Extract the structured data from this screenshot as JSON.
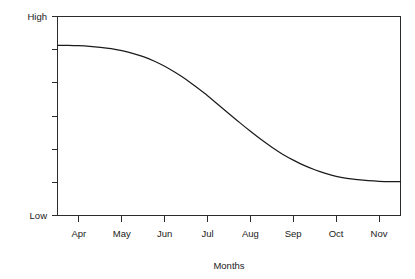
{
  "chart_data": {
    "type": "line",
    "title": "",
    "subtitle": "",
    "xlabel": "Months",
    "ylabel": "",
    "grid": false,
    "legend": null,
    "legend_position": "none",
    "categories": [
      "Apr",
      "May",
      "Jun",
      "Jul",
      "Aug",
      "Sep",
      "Oct",
      "Nov"
    ],
    "x_tick_labels": [
      "Apr",
      "May",
      "Jun",
      "Jul",
      "Aug",
      "Sep",
      "Oct",
      "Nov"
    ],
    "y_tick_labels": [
      "High",
      "",
      "",
      "",
      "",
      "",
      "Low"
    ],
    "y_axis_top_label": "High",
    "y_axis_bottom_label": "Low",
    "ylim": [
      0,
      6
    ],
    "y_tick_values": [
      0,
      1,
      2,
      3,
      4,
      5,
      6
    ],
    "xlim": [
      0,
      8
    ],
    "series": [
      {
        "name": "Trend",
        "color": "#1a1a1a",
        "x": [
          0.0,
          0.25,
          0.5,
          0.75,
          1.0,
          1.25,
          1.5,
          1.75,
          2.0,
          2.25,
          2.5,
          2.75,
          3.0,
          3.25,
          3.5,
          3.75,
          4.0,
          4.25,
          4.5,
          4.75,
          5.0,
          5.25,
          5.5,
          5.75,
          6.0,
          6.25,
          6.5,
          6.75,
          7.0,
          7.25,
          7.5,
          7.75,
          8.0
        ],
        "values": [
          5.13,
          5.13,
          5.12,
          5.1,
          5.07,
          5.03,
          4.97,
          4.89,
          4.79,
          4.66,
          4.5,
          4.31,
          4.1,
          3.86,
          3.61,
          3.34,
          3.07,
          2.8,
          2.54,
          2.29,
          2.06,
          1.85,
          1.67,
          1.51,
          1.38,
          1.27,
          1.18,
          1.12,
          1.08,
          1.05,
          1.03,
          1.02,
          1.02
        ]
      }
    ],
    "annotations": []
  },
  "axis": {
    "y_high_label": "High",
    "y_low_label": "Low",
    "x_title": "Months"
  },
  "colors": {
    "line": "#1a1a1a",
    "frame": "#2b2b2b",
    "background": "#ffffff",
    "text": "#1a1a1a"
  }
}
